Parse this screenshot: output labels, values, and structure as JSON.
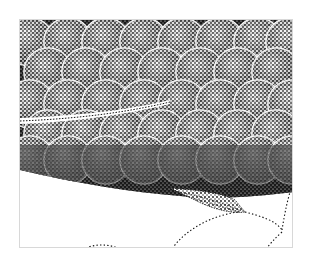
{
  "image": {
    "subject": "stippled illustration of fish scales with pelvic fin",
    "style": "black ink stipple on white",
    "colors": {
      "ink": "#111111",
      "paper": "#ffffff",
      "frame": "#d8d8d8"
    }
  },
  "scales": {
    "rows": [
      {
        "y": 22,
        "xs": [
          10,
          48,
          86,
          124,
          162,
          200,
          238,
          270
        ]
      },
      {
        "y": 52,
        "xs": [
          28,
          66,
          104,
          142,
          180,
          218,
          256
        ]
      },
      {
        "y": 84,
        "xs": [
          10,
          48,
          86,
          124,
          162,
          200,
          238,
          272
        ]
      },
      {
        "y": 114,
        "xs": [
          28,
          66,
          104,
          142,
          180,
          218,
          256
        ]
      },
      {
        "y": 140,
        "xs": [
          10,
          48,
          86,
          124,
          162,
          200,
          238,
          272
        ]
      }
    ],
    "radius": 24
  }
}
